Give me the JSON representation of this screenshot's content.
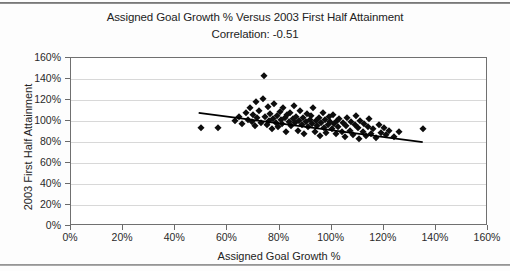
{
  "page": {
    "top_rule": "",
    "bottom_rule": ""
  },
  "chart_data": {
    "type": "scatter",
    "title": "Assigned Goal Growth % Versus 2003 First Half Attainment",
    "subtitle": "Correlation: -0.51",
    "correlation": -0.51,
    "xlabel": "Assigned Goal Growth %",
    "ylabel": "2003 First Half Attainment",
    "xlim": [
      0,
      160
    ],
    "ylim": [
      0,
      160
    ],
    "xticks": [
      0,
      20,
      40,
      60,
      80,
      100,
      120,
      140,
      160
    ],
    "yticks": [
      0,
      20,
      40,
      60,
      80,
      100,
      120,
      140,
      160
    ],
    "xtick_labels": [
      "0%",
      "20%",
      "40%",
      "60%",
      "80%",
      "100%",
      "120%",
      "140%",
      "160%"
    ],
    "ytick_labels": [
      "0%",
      "20%",
      "40%",
      "60%",
      "80%",
      "100%",
      "120%",
      "140%",
      "160%"
    ],
    "grid": "horizontal",
    "legend": "none",
    "marker_shape": "diamond",
    "marker_color": "#0d0d0d",
    "trendline": {
      "visible": true,
      "color": "#000000",
      "x0": 49,
      "y0": 107,
      "x1": 136,
      "y1": 79
    },
    "points": [
      [
        50.0,
        93.0
      ],
      [
        56.5,
        93.0
      ],
      [
        63.0,
        100.0
      ],
      [
        64.5,
        104.0
      ],
      [
        65.5,
        97.0
      ],
      [
        67.0,
        108.0
      ],
      [
        68.0,
        101.0
      ],
      [
        68.5,
        112.0
      ],
      [
        69.5,
        99.0
      ],
      [
        70.0,
        106.0
      ],
      [
        70.5,
        95.0
      ],
      [
        71.0,
        118.0
      ],
      [
        71.5,
        103.0
      ],
      [
        72.0,
        110.0
      ],
      [
        73.0,
        98.0
      ],
      [
        73.5,
        121.0
      ],
      [
        74.0,
        143.0
      ],
      [
        74.5,
        104.0
      ],
      [
        75.0,
        96.0
      ],
      [
        75.5,
        113.0
      ],
      [
        76.0,
        100.0
      ],
      [
        76.5,
        107.0
      ],
      [
        77.0,
        92.0
      ],
      [
        77.5,
        102.0
      ],
      [
        78.0,
        116.0
      ],
      [
        78.5,
        98.0
      ],
      [
        79.0,
        105.0
      ],
      [
        79.5,
        94.0
      ],
      [
        80.0,
        109.0
      ],
      [
        80.5,
        101.0
      ],
      [
        81.0,
        97.0
      ],
      [
        81.5,
        112.0
      ],
      [
        82.0,
        103.0
      ],
      [
        82.5,
        90.0
      ],
      [
        83.0,
        106.0
      ],
      [
        83.5,
        99.0
      ],
      [
        84.0,
        108.0
      ],
      [
        84.5,
        95.0
      ],
      [
        85.0,
        102.0
      ],
      [
        85.5,
        114.0
      ],
      [
        86.0,
        98.0
      ],
      [
        86.5,
        104.0
      ],
      [
        87.0,
        91.0
      ],
      [
        87.5,
        100.0
      ],
      [
        88.0,
        110.0
      ],
      [
        88.5,
        96.0
      ],
      [
        89.0,
        103.0
      ],
      [
        89.5,
        88.0
      ],
      [
        90.0,
        99.0
      ],
      [
        90.5,
        107.0
      ],
      [
        91.0,
        94.0
      ],
      [
        91.5,
        101.0
      ],
      [
        92.0,
        105.0
      ],
      [
        92.5,
        97.0
      ],
      [
        93.0,
        112.0
      ],
      [
        93.5,
        90.0
      ],
      [
        94.0,
        100.0
      ],
      [
        94.5,
        95.0
      ],
      [
        95.0,
        103.0
      ],
      [
        95.5,
        86.0
      ],
      [
        96.0,
        98.0
      ],
      [
        96.5,
        108.0
      ],
      [
        97.0,
        93.0
      ],
      [
        97.5,
        101.0
      ],
      [
        98.0,
        89.0
      ],
      [
        98.5,
        96.0
      ],
      [
        99.0,
        104.0
      ],
      [
        99.5,
        99.0
      ],
      [
        100.0,
        92.0
      ],
      [
        100.5,
        106.0
      ],
      [
        101.0,
        97.0
      ],
      [
        101.5,
        88.0
      ],
      [
        102.0,
        100.0
      ],
      [
        102.5,
        94.0
      ],
      [
        103.0,
        102.0
      ],
      [
        104.0,
        90.0
      ],
      [
        104.5,
        98.0
      ],
      [
        105.0,
        85.0
      ],
      [
        105.5,
        95.0
      ],
      [
        106.0,
        103.0
      ],
      [
        107.0,
        91.0
      ],
      [
        107.5,
        99.0
      ],
      [
        108.0,
        87.0
      ],
      [
        109.0,
        96.0
      ],
      [
        109.5,
        105.0
      ],
      [
        110.0,
        93.0
      ],
      [
        110.5,
        83.0
      ],
      [
        111.0,
        100.0
      ],
      [
        112.0,
        90.0
      ],
      [
        112.5,
        97.0
      ],
      [
        113.0,
        86.0
      ],
      [
        114.0,
        94.0
      ],
      [
        114.5,
        102.0
      ],
      [
        115.0,
        88.0
      ],
      [
        116.0,
        92.0
      ],
      [
        117.0,
        84.0
      ],
      [
        118.0,
        96.0
      ],
      [
        119.0,
        89.0
      ],
      [
        120.0,
        93.0
      ],
      [
        121.0,
        87.0
      ],
      [
        122.0,
        91.0
      ],
      [
        124.0,
        85.0
      ],
      [
        126.0,
        90.0
      ],
      [
        135.0,
        92.0
      ]
    ]
  }
}
